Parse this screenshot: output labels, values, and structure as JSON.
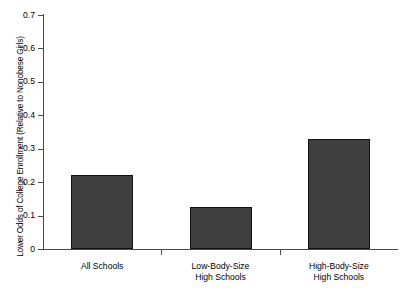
{
  "chart_data": {
    "type": "bar",
    "title": "",
    "xlabel": "",
    "ylabel": "Lower Odds of College Enrollment (Relative to Nonobese Girls)",
    "categories": [
      "All Schools",
      "Low-Body-Size\nHigh Schools",
      "High-Body-Size\nHigh Schools"
    ],
    "values": [
      0.22,
      0.125,
      0.33
    ],
    "ylim": [
      0,
      0.7
    ],
    "yticks": [
      0,
      0.1,
      0.2,
      0.3,
      0.4,
      0.5,
      0.6,
      0.7
    ],
    "ytick_labels": [
      "0",
      "0.1",
      "0.2",
      "0.3",
      "0.4",
      "0.5",
      "0.6",
      "0.7"
    ],
    "grid": false,
    "legend": null,
    "bar_fill_color": "#3f3f3f",
    "bar_edge_color": "#121212",
    "axis_color": "#4a4a4a",
    "background_color": "#ffffff"
  }
}
